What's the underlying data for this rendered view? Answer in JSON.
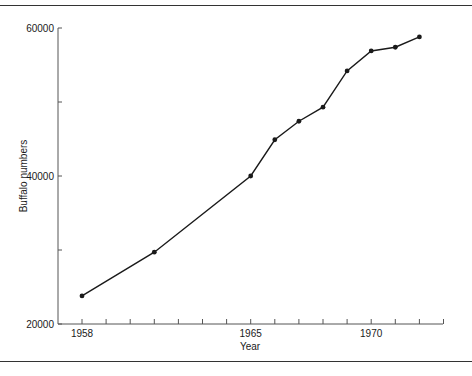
{
  "chart_data": {
    "type": "line",
    "title": "",
    "xlabel": "Year",
    "ylabel": "Buffalo numbers",
    "x": [
      1958,
      1961,
      1965,
      1966,
      1967,
      1968,
      1969,
      1970,
      1971,
      1972
    ],
    "series": [
      {
        "name": "Buffalo numbers",
        "values": [
          23800,
          29700,
          40000,
          44900,
          47400,
          49300,
          54200,
          56900,
          57400,
          58800
        ]
      }
    ],
    "xlim": [
      1958,
      1973
    ],
    "ylim": [
      20000,
      60000
    ],
    "x_tick_labels": [
      "1958",
      "1965",
      "1970"
    ],
    "x_minor_ticks": [
      1958,
      1959,
      1960,
      1961,
      1962,
      1963,
      1964,
      1965,
      1966,
      1967,
      1968,
      1969,
      1970,
      1971,
      1972,
      1973
    ],
    "y_tick_labels": [
      "20000",
      "40000",
      "60000"
    ],
    "y_minor_ticks": [
      30000,
      50000
    ],
    "grid": false,
    "legend": "none",
    "markers": "filled-circle",
    "line_color": "#1a1a1a"
  }
}
